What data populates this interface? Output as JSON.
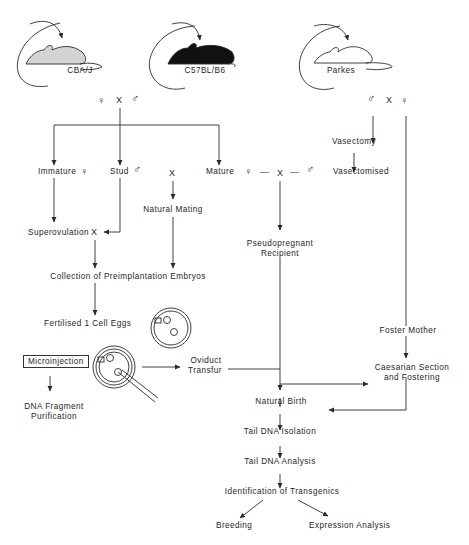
{
  "figure": {
    "strains": [
      {
        "id": "cba",
        "label": "CBA/J",
        "fill": "#d4d4d4"
      },
      {
        "id": "c57",
        "label": "C57BL/B6",
        "fill": "#111111"
      },
      {
        "id": "parkes",
        "label": "Parkes",
        "fill": "#ffffff"
      }
    ],
    "symbols": {
      "female": "♀",
      "male": "♂",
      "cross": "X",
      "dash": "—"
    },
    "nodes": {
      "immature": "Immature",
      "stud": "Stud",
      "mature": "Mature",
      "natural_mating": "Natural Mating",
      "superovulation": "Superovulation",
      "collection": "Collection of Preimplantation Embryos",
      "fertilised": "Fertilised 1 Cell Eggs",
      "vasectomy": "Vasectomy",
      "vasectomised": "Vasectomised",
      "pseudopregnant_1": "Pseudopregnant",
      "pseudopregnant_2": "Recipient",
      "microinjection": "Microinjection",
      "dna_fragment_1": "DNA Fragment",
      "dna_fragment_2": "Purification",
      "oviduct_1": "Oviduct",
      "oviduct_2": "Transfur",
      "foster_mother": "Foster Mother",
      "caesarian_1": "Caesarian Section",
      "caesarian_2": "and Fostering",
      "natural_birth": "Natural Birth",
      "tail_isolation": "Tail DNA Isolation",
      "tail_analysis": "Tail DNA Analysis",
      "identification": "Identification of Transgenics",
      "breeding": "Breeding",
      "expression": "Expression Analysis"
    },
    "line_color": "#2a2a2a"
  }
}
